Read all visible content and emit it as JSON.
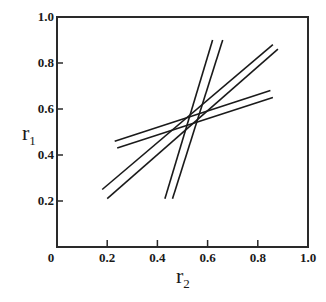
{
  "chart_data": {
    "type": "line",
    "title": "",
    "xlabel": "r",
    "xlabel_sub": "2",
    "ylabel": "r",
    "ylabel_sub": "1",
    "xlim": [
      0,
      1.0
    ],
    "ylim": [
      0,
      1.0
    ],
    "grid": false,
    "legend": null,
    "x_ticks": [
      "0",
      "0.2",
      "0.4",
      "0.6",
      "0.8",
      "1.0"
    ],
    "y_ticks": [
      "0.2",
      "0.4",
      "0.6",
      "0.8",
      "1.0"
    ],
    "series": [
      {
        "name": "steep-line-1",
        "x": [
          0.43,
          0.62
        ],
        "y": [
          0.21,
          0.9
        ]
      },
      {
        "name": "steep-line-2",
        "x": [
          0.46,
          0.66
        ],
        "y": [
          0.21,
          0.9
        ]
      },
      {
        "name": "medium-line-1",
        "x": [
          0.18,
          0.86
        ],
        "y": [
          0.25,
          0.88
        ]
      },
      {
        "name": "medium-line-2",
        "x": [
          0.2,
          0.88
        ],
        "y": [
          0.21,
          0.86
        ]
      },
      {
        "name": "shallow-line-1",
        "x": [
          0.23,
          0.85
        ],
        "y": [
          0.46,
          0.68
        ]
      },
      {
        "name": "shallow-line-2",
        "x": [
          0.24,
          0.86
        ],
        "y": [
          0.43,
          0.65
        ]
      }
    ]
  },
  "style": {
    "line_color": "#1a1a1a",
    "axis_color": "#2a2a2a",
    "background": "#ffffff"
  }
}
